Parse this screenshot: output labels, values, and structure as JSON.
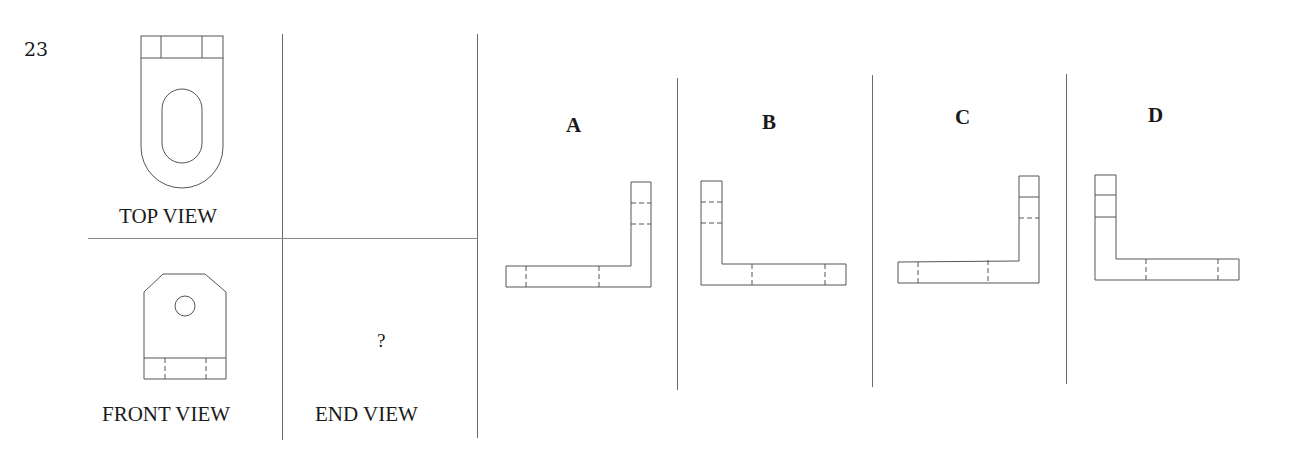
{
  "question": {
    "number": "23",
    "prompt_mark": "?"
  },
  "views": {
    "top_label": "TOP VIEW",
    "front_label": "FRONT VIEW",
    "end_label": "END VIEW"
  },
  "options": [
    {
      "label": "A",
      "upright_side": "right",
      "upright_dividers": [
        "hidden",
        "hidden"
      ],
      "base_dividers": [
        "hidden",
        "hidden"
      ]
    },
    {
      "label": "B",
      "upright_side": "left",
      "upright_dividers": [
        "hidden",
        "hidden"
      ],
      "base_dividers": [
        "hidden",
        "hidden"
      ]
    },
    {
      "label": "C",
      "upright_side": "right",
      "upright_dividers": [
        "visible",
        "hidden"
      ],
      "base_dividers": [
        "hidden",
        "hidden"
      ]
    },
    {
      "label": "D",
      "upright_side": "left",
      "upright_dividers": [
        "visible",
        "visible"
      ],
      "base_dividers": [
        "hidden",
        "hidden"
      ]
    }
  ],
  "colors": {
    "line": "#555555",
    "divider": "#6a6a6a",
    "text": "#1a1a1a",
    "background": "#ffffff"
  }
}
